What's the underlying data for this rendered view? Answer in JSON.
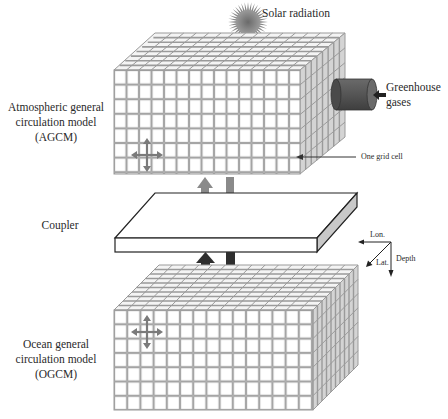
{
  "labels": {
    "solar": "Solar radiation",
    "greenhouse_line1": "Greenhouse",
    "greenhouse_line2": "gases",
    "agcm_line1": "Atmospheric general",
    "agcm_line2": "circulation model",
    "agcm_line3": "(AGCM)",
    "grid_cell": "One grid cell",
    "coupler": "Coupler",
    "ogcm_line1": "Ocean general",
    "ogcm_line2": "circulation model",
    "ogcm_line3": "(OGCM)",
    "axis_lon": "Lon.",
    "axis_lat": "Lat.",
    "axis_depth": "Depth"
  },
  "components": {
    "atmosphere_grid": {
      "columns": 15,
      "rows": 7,
      "depth_rows": 8
    },
    "ocean_grid": {
      "columns": 15,
      "rows": 7,
      "depth_rows": 10
    }
  },
  "colors": {
    "grid_line": "#9a9a9a",
    "cell_fill": "#ffffff",
    "side_shade": "#d4d4d4",
    "sun": "#7a7a7a",
    "cylinder": "#5a5a5a",
    "arrow_light": "#8a8a8a",
    "arrow_dark": "#2e2e2e",
    "slab_edge": "#c8c8c8"
  }
}
